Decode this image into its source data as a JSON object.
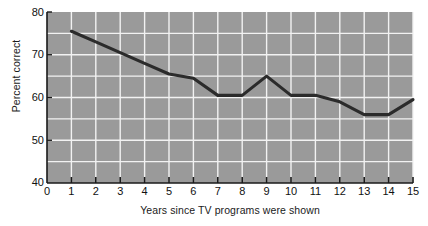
{
  "chart_data": {
    "type": "line",
    "title": "",
    "xlabel": "Years since TV programs were shown",
    "ylabel": "Percent correct",
    "x": [
      1,
      2,
      3,
      4,
      5,
      6,
      7,
      8,
      9,
      10,
      11,
      12,
      13,
      14,
      15
    ],
    "values": [
      75.5,
      73.0,
      70.5,
      68.0,
      65.5,
      64.5,
      60.5,
      60.5,
      65.0,
      60.5,
      60.5,
      59.0,
      56.0,
      56.0,
      59.5
    ],
    "series": [
      {
        "name": "Percent correct",
        "values": [
          75.5,
          73.0,
          70.5,
          68.0,
          65.5,
          64.5,
          60.5,
          60.5,
          65.0,
          60.5,
          60.5,
          59.0,
          56.0,
          56.0,
          59.5
        ]
      }
    ],
    "xlim": [
      0,
      15
    ],
    "ylim": [
      40,
      80
    ],
    "x_tick_labels": [
      "0",
      "1",
      "2",
      "3",
      "4",
      "5",
      "6",
      "7",
      "8",
      "9",
      "10",
      "11",
      "12",
      "13",
      "14",
      "15"
    ],
    "x_ticks": [
      0,
      1,
      2,
      3,
      4,
      5,
      6,
      7,
      8,
      9,
      10,
      11,
      12,
      13,
      14,
      15
    ],
    "y_tick_labels": [
      "40",
      "50",
      "60",
      "70",
      "80"
    ],
    "y_ticks": [
      40,
      50,
      60,
      70,
      80
    ],
    "y_gridlines": [
      45,
      50,
      55,
      60,
      65,
      70,
      75
    ],
    "x_gridlines": [
      1,
      2,
      3,
      4,
      5,
      6,
      7,
      8,
      9,
      10,
      11,
      12,
      13,
      14,
      15
    ],
    "grid": true,
    "legend": "none",
    "colors": {
      "plot_background": "#9a9a9a",
      "gridline": "#f2f2f2",
      "line": "#2b2b2b",
      "axis": "#1a1a1a",
      "page_background": "#ffffff",
      "text": "#111111"
    }
  }
}
